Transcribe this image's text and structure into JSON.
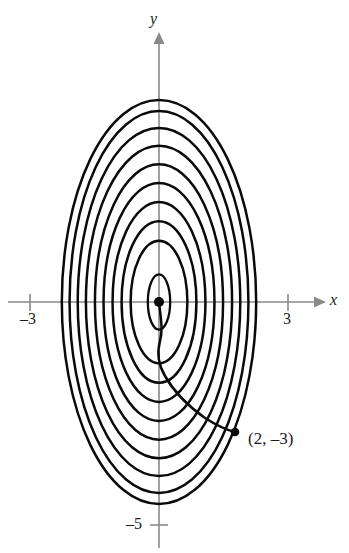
{
  "figure": {
    "title": "",
    "width": 349,
    "height": 553,
    "background_color": "#ffffff",
    "curve_color": "#0a0a0a",
    "axis_color": "#8a8a8a",
    "text_color": "#1a1a1a"
  },
  "axes": {
    "x_axis_label": "x",
    "y_axis_label": "y",
    "x_ticks": [
      {
        "value": -3,
        "label": "–3"
      },
      {
        "value": 3,
        "label": "3"
      }
    ],
    "y_ticks": [
      {
        "value": -5,
        "label": "–5"
      }
    ],
    "origin_px": {
      "x": 159,
      "y": 302
    },
    "units_per_px_x": 43,
    "units_per_px_y": 44.4,
    "xlim": [
      -3.5,
      4.4
    ],
    "ylim": [
      -5.7,
      6.2
    ]
  },
  "annotations": {
    "point_label": "(2, –3)",
    "point_value": {
      "x": 2,
      "y": -3
    },
    "origin_point_label": ""
  },
  "chart_data": {
    "type": "line",
    "title": "",
    "xlabel": "x",
    "ylabel": "y",
    "grid": false,
    "legend": null,
    "xlim": [
      -3.5,
      4.4
    ],
    "ylim": [
      -5.7,
      6.2
    ],
    "series": [
      {
        "name": "ellipse-1",
        "type": "ellipse",
        "center": [
          0,
          0
        ],
        "semi_axis_x": 0.26,
        "semi_axis_y": 0.62
      },
      {
        "name": "ellipse-2",
        "type": "ellipse",
        "center": [
          0,
          0
        ],
        "semi_axis_x": 0.66,
        "semi_axis_y": 1.38
      },
      {
        "name": "ellipse-3",
        "type": "ellipse",
        "center": [
          0,
          0
        ],
        "semi_axis_x": 0.87,
        "semi_axis_y": 1.82
      },
      {
        "name": "ellipse-4",
        "type": "ellipse",
        "center": [
          0,
          0
        ],
        "semi_axis_x": 1.08,
        "semi_axis_y": 2.25
      },
      {
        "name": "ellipse-5",
        "type": "ellipse",
        "center": [
          0,
          0
        ],
        "semi_axis_x": 1.29,
        "semi_axis_y": 2.68
      },
      {
        "name": "ellipse-6",
        "type": "ellipse",
        "center": [
          0,
          0
        ],
        "semi_axis_x": 1.49,
        "semi_axis_y": 3.1
      },
      {
        "name": "ellipse-7",
        "type": "ellipse",
        "center": [
          0,
          0
        ],
        "semi_axis_x": 1.7,
        "semi_axis_y": 3.52
      },
      {
        "name": "ellipse-8",
        "type": "ellipse",
        "center": [
          0,
          0
        ],
        "semi_axis_x": 1.89,
        "semi_axis_y": 3.92
      },
      {
        "name": "ellipse-9",
        "type": "ellipse",
        "center": [
          0,
          0
        ],
        "semi_axis_x": 2.08,
        "semi_axis_y": 4.3
      },
      {
        "name": "ellipse-10",
        "type": "ellipse",
        "center": [
          0,
          0
        ],
        "semi_axis_x": 2.26,
        "semi_axis_y": 4.55
      }
    ],
    "points": [
      {
        "label": "(2, –3)",
        "x": 2,
        "y": -3
      },
      {
        "label": "",
        "x": 0,
        "y": 0
      }
    ]
  }
}
